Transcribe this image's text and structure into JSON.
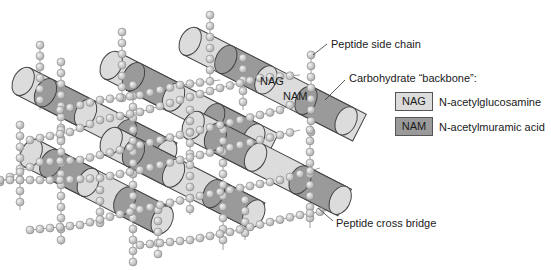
{
  "labels": {
    "peptide_side_chain": "Peptide side chain",
    "carbohydrate_backbone": "Carbohydrate “backbone”:",
    "peptide_cross_bridge": "Peptide cross bridge",
    "on_cylinder_nag": "NAG",
    "on_cylinder_nam": "NAM"
  },
  "legend": [
    {
      "abbr": "NAG",
      "name": "N-acetylglucosamine",
      "color": "#dcdcdc"
    },
    {
      "abbr": "NAM",
      "name": "N-acetylmuramic acid",
      "color": "#9a9a9a"
    }
  ],
  "colors": {
    "nag": "#dcdcdc",
    "nam": "#9a9a9a",
    "bead": "#c8c8c8",
    "outline": "#444444"
  }
}
